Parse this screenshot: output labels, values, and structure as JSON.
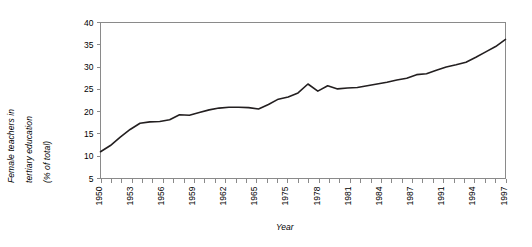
{
  "chart_data": {
    "type": "line",
    "title": "",
    "xlabel": "Year",
    "ylabel": "Female teachers in tertiary education (% of total)",
    "ylabel_lines": [
      "Female teachers in",
      "tertiary education",
      "(% of total)"
    ],
    "ylim": [
      5,
      40
    ],
    "yticks": [
      5,
      10,
      15,
      20,
      25,
      30,
      35,
      40
    ],
    "ytick_labels": [
      "5",
      "10",
      "15",
      "20",
      "25",
      "30",
      "35",
      "40"
    ],
    "xtick_labels": [
      "1950",
      "1953",
      "1956",
      "1959",
      "1962",
      "1965",
      "1975",
      "1978",
      "1981",
      "1984",
      "1987",
      "1991",
      "1994",
      "1997"
    ],
    "xtick_label_indices": [
      0,
      3,
      6,
      9,
      12,
      15,
      18,
      21,
      24,
      27,
      30,
      33,
      36,
      39
    ],
    "grid": false,
    "legend": "none",
    "series": [
      {
        "name": "Female teachers in tertiary education (% of total)",
        "color": "#231f20",
        "x": [
          "1950",
          "1951",
          "1952",
          "1953",
          "1954",
          "1955",
          "1956",
          "1957",
          "1958",
          "1959",
          "1960",
          "1961",
          "1962",
          "1963",
          "1964",
          "1965",
          "1973",
          "1974",
          "1975",
          "1976",
          "1977",
          "1978",
          "1979",
          "1980",
          "1981",
          "1982",
          "1983",
          "1984",
          "1985",
          "1986",
          "1987",
          "1988",
          "1989",
          "1990",
          "1991",
          "1992",
          "1993",
          "1994",
          "1995",
          "1996",
          "1997",
          "1998"
        ],
        "values": [
          11.0,
          12.4,
          14.3,
          16.0,
          17.4,
          17.7,
          17.8,
          18.2,
          19.3,
          19.2,
          19.8,
          20.4,
          20.8,
          21.0,
          21.0,
          20.9,
          20.6,
          21.6,
          22.8,
          23.3,
          24.2,
          26.2,
          24.6,
          25.8,
          25.1,
          25.3,
          25.4,
          25.8,
          26.2,
          26.6,
          27.1,
          27.5,
          28.3,
          28.5,
          29.3,
          30.0,
          30.5,
          31.1,
          32.2,
          33.4,
          34.6,
          36.2
        ]
      }
    ]
  }
}
